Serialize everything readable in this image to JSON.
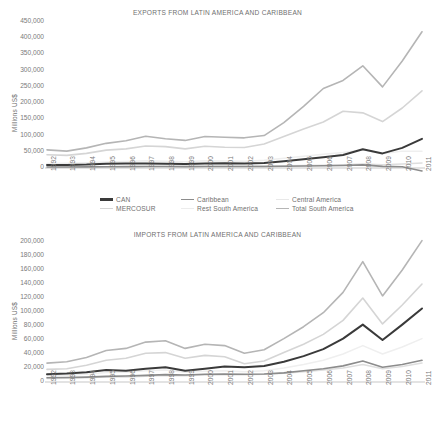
{
  "chart_data": [
    {
      "type": "line",
      "id": "exports",
      "title": "EXPORTS FROM LATIN AMERICA AND CARIBBEAN",
      "xlabel": "",
      "ylabel": "Millions US$",
      "ylim": [
        0,
        450000
      ],
      "ytick_step": 50000,
      "yticks": [
        "0",
        "50,000",
        "100,000",
        "150,000",
        "200,000",
        "250,000",
        "300,000",
        "350,000",
        "400,000",
        "450,000"
      ],
      "grid": false,
      "legend_position": "bottom",
      "x": [
        1992,
        1993,
        1994,
        1995,
        1996,
        1997,
        1998,
        1999,
        2000,
        2001,
        2002,
        2003,
        2004,
        2005,
        2006,
        2007,
        2008,
        2009,
        2010,
        2011
      ],
      "categories": [
        "1992",
        "1993",
        "1994",
        "1995",
        "1996",
        "1997",
        "1998",
        "1999",
        "2000",
        "2001",
        "2002",
        "2003",
        "2004",
        "2005",
        "2006",
        "2007",
        "2008",
        "2009",
        "2010",
        "2011"
      ],
      "series": [
        {
          "name": "CAN",
          "color": "#3a3a3a",
          "width": 2.0,
          "values": [
            9000,
            9500,
            10500,
            13000,
            13500,
            14000,
            13000,
            12000,
            14000,
            14500,
            13500,
            15500,
            21000,
            27000,
            33000,
            40000,
            58000,
            45000,
            62000,
            90000
          ]
        },
        {
          "name": "Caribbean",
          "color": "#8c8c8c",
          "width": 1.6,
          "values": [
            3000,
            3200,
            3400,
            4000,
            4200,
            4500,
            4400,
            4200,
            4600,
            4700,
            4500,
            4700,
            5200,
            6000,
            6800,
            7600,
            9500,
            5000,
            4000,
            -9000
          ]
        },
        {
          "name": "Central America",
          "color": "#dedede",
          "width": 1.5,
          "values": [
            2500,
            2800,
            3100,
            3600,
            3900,
            4400,
            4800,
            4700,
            5200,
            5400,
            5500,
            5800,
            6600,
            7600,
            8800,
            10200,
            12000,
            10000,
            12500,
            15500
          ]
        },
        {
          "name": "MERCOSUR",
          "color": "#d5d5d5",
          "width": 1.6,
          "values": [
            41000,
            39000,
            45000,
            55000,
            59000,
            68000,
            66000,
            59000,
            67000,
            64000,
            63000,
            74000,
            97000,
            120000,
            142000,
            175000,
            170000,
            143000,
            185000,
            238000
          ]
        },
        {
          "name": "Rest South America",
          "color": "#efefef",
          "width": 1.5,
          "values": [
            14000,
            14500,
            16000,
            18500,
            20000,
            22500,
            20500,
            19500,
            22000,
            21500,
            21000,
            24000,
            30000,
            36000,
            42000,
            48000,
            56000,
            44000,
            52000,
            52000
          ]
        },
        {
          "name": "Total South America",
          "color": "#b5b5b5",
          "width": 1.6,
          "values": [
            56000,
            52000,
            62000,
            76000,
            84000,
            98000,
            90000,
            85000,
            97000,
            95000,
            93000,
            100000,
            140000,
            190000,
            245000,
            270000,
            315000,
            250000,
            330000,
            420000
          ]
        }
      ]
    },
    {
      "type": "line",
      "id": "imports",
      "title": "IMPORTS FROM LATIN AMERICA AND CARIBBEAN",
      "xlabel": "",
      "ylabel": "Millions US$",
      "ylim": [
        0,
        200000
      ],
      "ytick_step": 20000,
      "yticks": [
        "0",
        "20,000",
        "40,000",
        "60,000",
        "80,000",
        "100,000",
        "120,000",
        "140,000",
        "160,000",
        "180,000",
        "200,000"
      ],
      "grid": false,
      "legend_position": "none",
      "x": [
        1992,
        1993,
        1994,
        1995,
        1996,
        1997,
        1998,
        1999,
        2000,
        2001,
        2002,
        2003,
        2004,
        2005,
        2006,
        2007,
        2008,
        2009,
        2010,
        2011
      ],
      "categories": [
        "1992",
        "1993",
        "1994",
        "1995",
        "1996",
        "1997",
        "1998",
        "1999",
        "2000",
        "2001",
        "2002",
        "2003",
        "2004",
        "2005",
        "2006",
        "2007",
        "2008",
        "2009",
        "2010",
        "2011"
      ],
      "series": [
        {
          "name": "CAN",
          "color": "#3a3a3a",
          "width": 2.0,
          "values": [
            11000,
            12000,
            14000,
            17000,
            16000,
            19000,
            21000,
            16000,
            19000,
            22000,
            21000,
            23000,
            29000,
            37000,
            47000,
            62000,
            82000,
            60000,
            82000,
            105000
          ]
        },
        {
          "name": "Caribbean",
          "color": "#8c8c8c",
          "width": 1.6,
          "values": [
            6000,
            6500,
            7000,
            8000,
            8500,
            9500,
            10500,
            10000,
            11000,
            11500,
            11000,
            11500,
            13000,
            16000,
            19000,
            23000,
            30000,
            21000,
            25000,
            31000
          ]
        },
        {
          "name": "Central America",
          "color": "#dedede",
          "width": 1.5,
          "values": [
            5000,
            5500,
            6200,
            7000,
            7300,
            8200,
            9200,
            9000,
            10000,
            10500,
            10500,
            11000,
            12500,
            14500,
            17000,
            20000,
            25000,
            19000,
            22000,
            27000
          ]
        },
        {
          "name": "MERCOSUR",
          "color": "#d5d5d5",
          "width": 1.6,
          "values": [
            18000,
            19000,
            24000,
            31000,
            34000,
            41000,
            42000,
            34000,
            38000,
            36000,
            26000,
            30000,
            42000,
            54000,
            68000,
            88000,
            120000,
            83000,
            110000,
            140000
          ]
        },
        {
          "name": "Rest South America",
          "color": "#efefef",
          "width": 1.5,
          "values": [
            9000,
            9500,
            11000,
            13500,
            14000,
            16000,
            17000,
            14000,
            15500,
            16000,
            14500,
            16000,
            20000,
            25000,
            31000,
            40000,
            52000,
            40000,
            50000,
            62000
          ]
        },
        {
          "name": "Total South America",
          "color": "#b5b5b5",
          "width": 1.6,
          "values": [
            27000,
            29000,
            35000,
            45000,
            48000,
            57000,
            59000,
            48000,
            54000,
            52000,
            41000,
            46000,
            62000,
            79000,
            99000,
            128000,
            172000,
            123000,
            160000,
            202000
          ]
        }
      ]
    }
  ],
  "exports_chart": {
    "title": "EXPORTS FROM LATIN AMERICA AND CARIBBEAN",
    "ylabel": "Millions US$"
  },
  "imports_chart": {
    "title": "IMPORTS FROM LATIN AMERICA AND CARIBBEAN",
    "ylabel": "Millions US$"
  },
  "legend": {
    "items": [
      {
        "label": "CAN",
        "color": "#3a3a3a",
        "width": 2.4
      },
      {
        "label": "Caribbean",
        "color": "#8c8c8c",
        "width": 1.8
      },
      {
        "label": "Central America",
        "color": "#e8e8e8",
        "width": 1.4
      },
      {
        "label": "MERCOSUR",
        "color": "#d5d5d5",
        "width": 1.6
      },
      {
        "label": "Rest South America",
        "color": "#ececec",
        "width": 1.4
      },
      {
        "label": "Total South America",
        "color": "#b5b5b5",
        "width": 1.6
      }
    ]
  }
}
